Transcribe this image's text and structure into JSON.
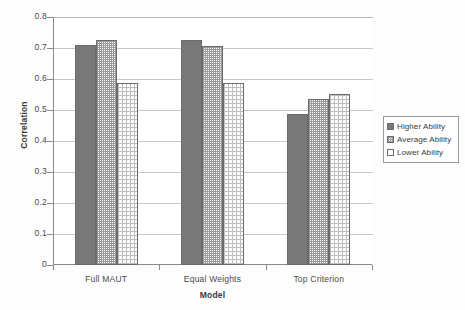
{
  "chart_data": {
    "type": "bar",
    "title": "",
    "xlabel": "Model",
    "ylabel": "Correlation",
    "categories": [
      "Full MAUT",
      "Equal Weights",
      "Top Criterion"
    ],
    "series": [
      {
        "name": "Higher  Ability",
        "values": [
          0.71,
          0.725,
          0.487
        ],
        "swatch": "solid-gray",
        "color": "#787878"
      },
      {
        "name": "Average  Ability",
        "values": [
          0.727,
          0.706,
          0.535
        ],
        "swatch": "checkered",
        "color": "#9a9a9a"
      },
      {
        "name": "Lower  Ability",
        "values": [
          0.588,
          0.587,
          0.552
        ],
        "swatch": "dotted-light",
        "color": "#ffffff"
      }
    ],
    "ylim": [
      0,
      0.8
    ],
    "yticks": [
      "0",
      "0.1",
      "0.2",
      "0.3",
      "0.4",
      "0.5",
      "0.6",
      "0.7",
      "0.8"
    ],
    "ytick_values": [
      0,
      0.1,
      0.2,
      0.3,
      0.4,
      0.5,
      0.6,
      0.7,
      0.8
    ],
    "grid": true,
    "legend_position": "right"
  }
}
